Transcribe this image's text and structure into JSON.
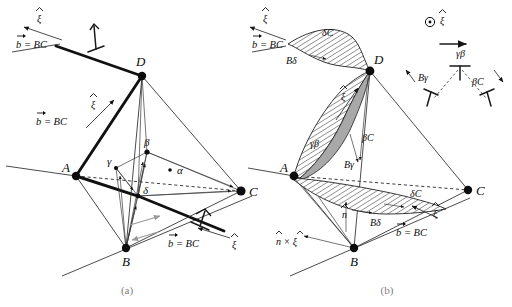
{
  "figure": {
    "background_color": "#ffffff",
    "ink_color": "#0d0d0d",
    "fault_shade_color": "#a8a8a8",
    "caption_color": "#7e7e7e"
  },
  "captions": {
    "panel_a": "(a)",
    "panel_b": "(b)"
  },
  "panel_a": {
    "name": "perfect-dislocation-panel",
    "vertices": [
      {
        "id": "A",
        "label": "A",
        "x": 76,
        "y": 176
      },
      {
        "id": "B",
        "label": "B",
        "x": 126,
        "y": 248
      },
      {
        "id": "C",
        "label": "C",
        "x": 241,
        "y": 191
      },
      {
        "id": "D",
        "label": "D",
        "x": 142,
        "y": 76
      }
    ],
    "inner_vertices": [
      {
        "id": "alpha",
        "label": "α",
        "x": 174,
        "y": 170
      },
      {
        "id": "beta",
        "label": "β",
        "x": 147,
        "y": 152
      },
      {
        "id": "gamma",
        "label": "γ",
        "x": 116,
        "y": 168
      },
      {
        "id": "delta",
        "label": "δ",
        "x": 138,
        "y": 196
      }
    ],
    "burgers_labels": [
      {
        "id": "b-upper-left",
        "text": "b = BC",
        "vector_symbol": "⃗",
        "x": 16,
        "y": 44
      },
      {
        "id": "b-mid-left",
        "text": "b = BC",
        "vector_symbol": "⃗",
        "x": 36,
        "y": 121
      },
      {
        "id": "b-lower-right",
        "text": "b = BC",
        "vector_symbol": "⃗",
        "x": 168,
        "y": 243
      }
    ],
    "line_direction_labels": [
      {
        "id": "xi-upper-left",
        "text": "ξ",
        "accent": "hat",
        "x": 38,
        "y": 17
      },
      {
        "id": "xi-mid-left",
        "text": "ξ",
        "accent": "hat",
        "x": 92,
        "y": 103
      },
      {
        "id": "xi-lower-right",
        "text": "ξ",
        "accent": "hat",
        "x": 233,
        "y": 243
      }
    ]
  },
  "panel_b": {
    "name": "dissociated-dislocation-panel",
    "vertices": [
      {
        "id": "A",
        "label": "A",
        "x": 294,
        "y": 176
      },
      {
        "id": "B",
        "label": "B",
        "x": 354,
        "y": 248
      },
      {
        "id": "C",
        "label": "C",
        "x": 468,
        "y": 190
      },
      {
        "id": "D",
        "label": "D",
        "x": 370,
        "y": 71
      }
    ],
    "fault_ribbon_labels": [
      {
        "id": "top-ribbon-upper",
        "text": "δC",
        "x": 322,
        "y": 32
      },
      {
        "id": "top-ribbon-lower",
        "text": "Bδ",
        "x": 288,
        "y": 60
      },
      {
        "id": "ad-ribbon-left",
        "text": "γβ",
        "x": 316,
        "y": 143
      },
      {
        "id": "ad-ribbon-mid",
        "text": "Bγ",
        "x": 348,
        "y": 163
      },
      {
        "id": "ad-ribbon-right",
        "text": "βC",
        "x": 364,
        "y": 137
      },
      {
        "id": "bot-ribbon-upper",
        "text": "δC",
        "x": 412,
        "y": 193
      },
      {
        "id": "bot-ribbon-lower",
        "text": "Bδ",
        "x": 372,
        "y": 222
      }
    ],
    "burgers_labels": [
      {
        "id": "b-upper-left",
        "text": "b = BC",
        "vector_symbol": "⃗",
        "x": 252,
        "y": 44
      },
      {
        "id": "b-lower-right",
        "text": "b = BC",
        "vector_symbol": "⃗",
        "x": 396,
        "y": 232
      }
    ],
    "line_direction_labels": [
      {
        "id": "xi-upper-left",
        "text": "ξ",
        "accent": "hat",
        "x": 264,
        "y": 17
      },
      {
        "id": "xi-ad-ribbon",
        "text": "ξ",
        "accent": "hat",
        "x": 342,
        "y": 95
      },
      {
        "id": "xi-lower-right",
        "text": "ξ",
        "accent": "hat",
        "x": 434,
        "y": 212
      }
    ],
    "normal_labels": [
      {
        "id": "n-hat",
        "text": "n",
        "accent": "hat",
        "x": 344,
        "y": 213
      },
      {
        "id": "n-cross-xi",
        "text": "n × ξ",
        "accent": "hat-both",
        "x": 282,
        "y": 240
      }
    ],
    "reaction_diagram": {
      "name": "dislocation-dissociation-inset",
      "screw_symbol": "⊙",
      "screw_label": "ξ",
      "screw_label_accent": "hat",
      "parent_label": "γβ",
      "partial_left_label": "Bγ",
      "partial_right_label": "βC",
      "parent_symbol": "⊥",
      "x": 458,
      "y": 24
    }
  }
}
